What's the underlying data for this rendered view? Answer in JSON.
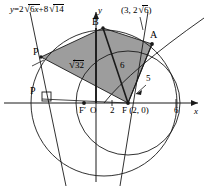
{
  "figure": {
    "axis": {
      "x_label": "x",
      "y_label": "y",
      "origin_label": "O",
      "x_ticks": [
        {
          "label": "2",
          "value": 2
        },
        {
          "label": "6",
          "value": 6
        }
      ]
    },
    "points": [
      {
        "name": "A",
        "label": "A",
        "coord_label": "(3, 2√6)"
      },
      {
        "name": "B",
        "label": "B"
      },
      {
        "name": "P-upper",
        "label": "P"
      },
      {
        "name": "P-lower",
        "label": "P"
      },
      {
        "name": "F",
        "label": "F",
        "coord_label": "F (2, 0)"
      },
      {
        "name": "F-prime",
        "label": "F′"
      }
    ],
    "line": {
      "equation_prefix": "y",
      "equation_eq": "=",
      "equation_c1": "2",
      "equation_r1": "6",
      "equation_var": "x",
      "equation_plus": "+",
      "equation_c2": "8",
      "equation_r2": "14",
      "equation_full": "y = 2√6x + 8√14"
    },
    "segment_labels": [
      {
        "name": "triangle-area",
        "text": "32"
      },
      {
        "name": "side-6",
        "text": "6"
      },
      {
        "name": "side-5",
        "text": "5"
      }
    ],
    "point_coord_a": {
      "open": "(3, 2",
      "radicand": "6",
      "close": ")"
    },
    "colors": {
      "stroke": "#1a1a1a",
      "fill_triangle": "#9d9d9d",
      "background": "#ffffff"
    }
  }
}
